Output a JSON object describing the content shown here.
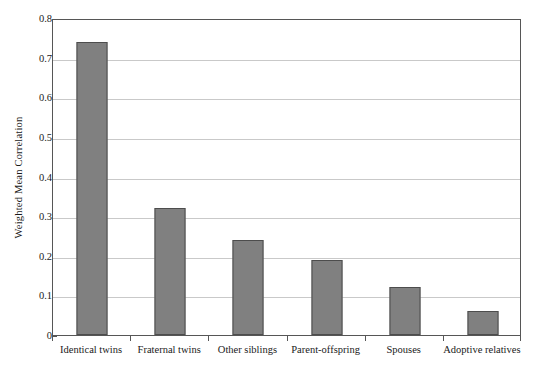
{
  "chart_data": {
    "type": "bar",
    "title": "",
    "subtitle": "",
    "xlabel": "",
    "ylabel": "Weighted Mean Correlation",
    "categories": [
      "Identical twins",
      "Fraternal twins",
      "Other siblings",
      "Parent-offspring",
      "Spouses",
      "Adoptive relatives"
    ],
    "values": [
      0.74,
      0.32,
      0.24,
      0.19,
      0.12,
      0.06
    ],
    "ylim": [
      0,
      0.8
    ],
    "ytick_labels": [
      "0.8",
      "0.7",
      "0.6",
      "0.5",
      "0.4",
      "0.3",
      "0.2",
      "0.1",
      "0"
    ],
    "ytick_values": [
      0.8,
      0.7,
      0.6,
      0.5,
      0.4,
      0.3,
      0.2,
      0.1,
      0
    ],
    "grid": true,
    "grid_axis": "y",
    "legend": null,
    "legend_position": "none",
    "bar_color": "#808080",
    "bar_edge_color": "#4d4d4d",
    "gridline_color": "#c9c9c9",
    "axis_color": "#565656",
    "background_color": "#ffffff"
  }
}
